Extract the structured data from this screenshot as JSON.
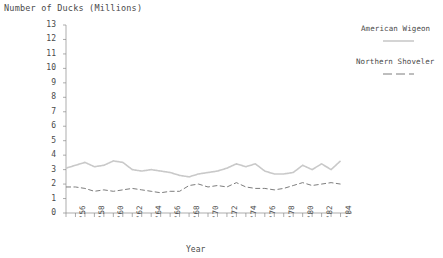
{
  "chart_data": {
    "type": "line",
    "title": "Number of Ducks (Millions)",
    "xlabel": "Year",
    "ylabel": "",
    "ylim": [
      0,
      13
    ],
    "xlim": [
      1955,
      1985
    ],
    "grid": false,
    "legend_position": "right",
    "ytick_labels": [
      "13",
      "12",
      "11",
      "10",
      "9",
      "8",
      "7",
      "6",
      "5",
      "4",
      "3",
      "2",
      "1",
      "0"
    ],
    "ytick_values": [
      13,
      12,
      11,
      10,
      9,
      8,
      7,
      6,
      5,
      4,
      3,
      2,
      1,
      0
    ],
    "xtick_labels": [
      "'56",
      "'58",
      "'60",
      "'62",
      "'64",
      "'66",
      "'68",
      "'70",
      "'72",
      "'74",
      "'76",
      "'78",
      "'80",
      "'82",
      "'84"
    ],
    "xtick_values": [
      1956,
      1958,
      1960,
      1962,
      1964,
      1966,
      1968,
      1970,
      1972,
      1974,
      1976,
      1978,
      1980,
      1982,
      1984
    ],
    "x": [
      1955,
      1956,
      1957,
      1958,
      1959,
      1960,
      1961,
      1962,
      1963,
      1964,
      1965,
      1966,
      1967,
      1968,
      1969,
      1970,
      1971,
      1972,
      1973,
      1974,
      1975,
      1976,
      1977,
      1978,
      1979,
      1980,
      1981,
      1982,
      1983,
      1984
    ],
    "series": [
      {
        "name": "American Wigeon",
        "color": "#c9c9c9",
        "linestyle": "dotted",
        "values": [
          3.1,
          3.3,
          3.5,
          3.2,
          3.3,
          3.6,
          3.5,
          3.0,
          2.9,
          3.0,
          2.9,
          2.8,
          2.6,
          2.5,
          2.7,
          2.8,
          2.9,
          3.1,
          3.4,
          3.2,
          3.4,
          2.9,
          2.7,
          2.7,
          2.8,
          3.3,
          3.0,
          3.4,
          3.0,
          3.6
        ],
        "legend_style": "light-solid"
      },
      {
        "name": "Northern Shoveler",
        "color": "#7d7d7d",
        "linestyle": "dashed",
        "values": [
          1.8,
          1.8,
          1.7,
          1.5,
          1.6,
          1.5,
          1.6,
          1.7,
          1.6,
          1.5,
          1.4,
          1.5,
          1.5,
          1.9,
          2.0,
          1.8,
          1.9,
          1.8,
          2.1,
          1.8,
          1.7,
          1.7,
          1.6,
          1.7,
          1.9,
          2.1,
          1.9,
          2.0,
          2.1,
          2.0
        ],
        "legend_style": "dashed"
      }
    ]
  },
  "legend": {
    "entries": [
      {
        "label": "American Wigeon"
      },
      {
        "label": "Northern Shoveler"
      }
    ]
  }
}
